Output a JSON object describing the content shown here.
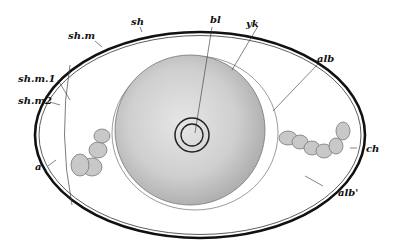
{
  "figure": {
    "labels": {
      "sh": "sh",
      "shm": "sh.m",
      "shm1": "sh.m.1",
      "shm2": "sh.m2",
      "bl": "bl",
      "yk": "yk",
      "alb": "alb",
      "a": "a",
      "ch": "ch",
      "alb_prime": "alb'"
    }
  }
}
